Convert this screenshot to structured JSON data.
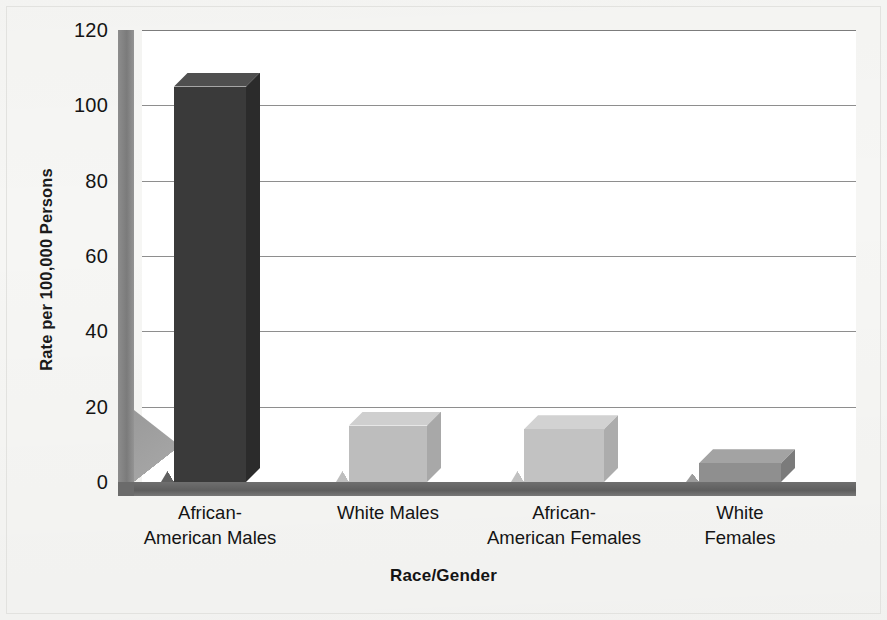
{
  "chart_data": {
    "type": "bar",
    "title": "",
    "subtitle": "",
    "xlabel": "Race/Gender",
    "ylabel": "Rate per 100,000 Persons",
    "categories": [
      "African-\nAmerican Males",
      "White Males",
      "African-\nAmerican Females",
      "White Females"
    ],
    "values": [
      105,
      15,
      14,
      5
    ],
    "ylim": [
      0,
      120
    ],
    "yticks": [
      "0",
      "20",
      "40",
      "60",
      "80",
      "100",
      "120"
    ],
    "ytick_values": [
      0,
      20,
      40,
      60,
      80,
      100,
      120
    ],
    "grid": "horizontal",
    "legend": "none",
    "style": "3d-bar",
    "bar_colors": [
      "#3a3a3a",
      "#bdbdbd",
      "#c2c2c2",
      "#8f8f8f"
    ],
    "bar_top_colors": [
      "#4f4f4f",
      "#cfcfcf",
      "#d2d2d2",
      "#a3a3a3"
    ],
    "bar_side_colors": [
      "#2b2b2b",
      "#a8a8a8",
      "#acacac",
      "#7b7b7b"
    ],
    "series": [
      {
        "name": "Rate per 100,000 Persons",
        "values": [
          105,
          15,
          14,
          5
        ]
      }
    ]
  },
  "axes": {
    "y_title": "Rate per 100,000 Persons",
    "x_title": "Race/Gender",
    "y_tick_labels": [
      "120",
      "100",
      "80",
      "60",
      "40",
      "20",
      "0"
    ],
    "x_tick_labels": [
      "African-\nAmerican Males",
      "White Males",
      "African-\nAmerican Females",
      "White Females"
    ]
  },
  "colors": {
    "background": "#f6f6f4",
    "plot_background": "#ffffff",
    "gridline": "#8e8e8e",
    "axis_wall": "#7b7b7b",
    "floor": "#5e5e5e",
    "text": "#141414",
    "bar_dark": "#3a3a3a",
    "bar_light": "#bdbdbd",
    "bar_medium": "#8f8f8f"
  }
}
